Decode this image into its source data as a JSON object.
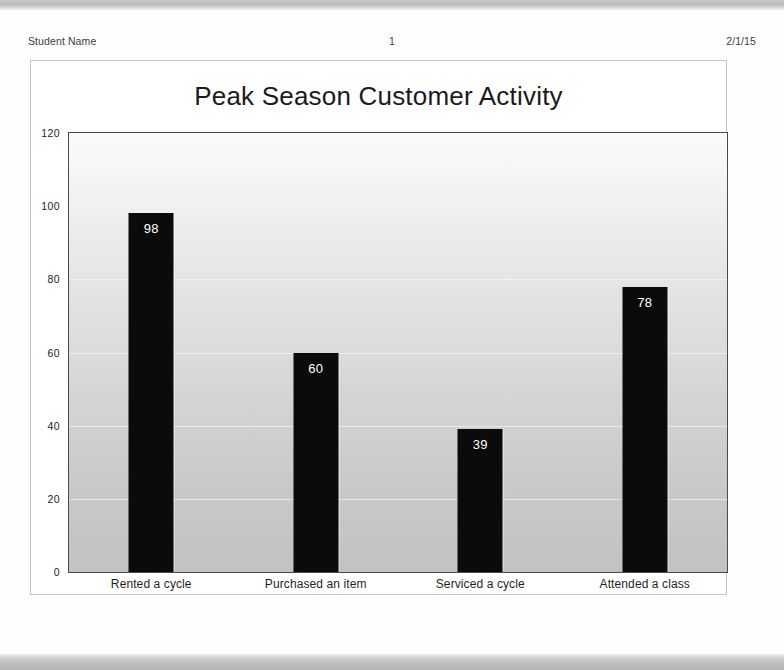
{
  "document": {
    "header": {
      "left": "Student Name",
      "center": "1",
      "right": "2/1/15"
    }
  },
  "chart_data": {
    "type": "bar",
    "title": "Peak Season Customer Activity",
    "xlabel": "",
    "ylabel": "",
    "categories": [
      "Rented a cycle",
      "Purchased an item",
      "Serviced a cycle",
      "Attended a class"
    ],
    "values": [
      98,
      60,
      39,
      78
    ],
    "ylim": [
      0,
      120
    ],
    "yticks": [
      0,
      20,
      40,
      60,
      80,
      100,
      120
    ],
    "ytick_labels": [
      "0",
      "20",
      "40",
      "60",
      "80",
      "100",
      "120"
    ],
    "grid": true,
    "legend": false,
    "data_labels": [
      "98",
      "60",
      "39",
      "78"
    ],
    "bar_color": "#0b0b0b",
    "data_label_color": "#ffffff",
    "plot_bg_top": "#fbfbfb",
    "plot_bg_bottom": "#c2c2c2"
  }
}
